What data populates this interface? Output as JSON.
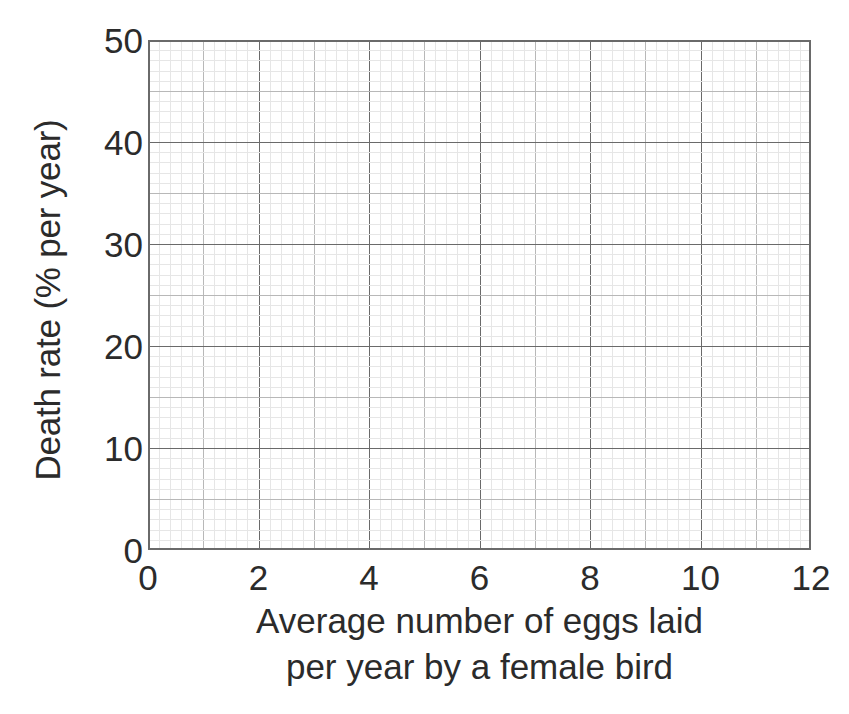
{
  "figure": {
    "background_color": "#ffffff",
    "text_color": "#2b2b2b"
  },
  "chart_data": {
    "type": "scatter",
    "title": "",
    "subtitle": "",
    "xlabel": "Average number of eggs laid per year by a female bird",
    "xlabel_line1": "Average number of eggs laid",
    "xlabel_line2": "per year by a female bird",
    "ylabel": "Death rate (% per year)",
    "xlim": [
      0,
      12
    ],
    "ylim": [
      0,
      50
    ],
    "xticks": [
      0,
      2,
      4,
      6,
      8,
      10,
      12
    ],
    "yticks": [
      0,
      10,
      20,
      30,
      40,
      50
    ],
    "xticklabels": [
      "0",
      "2",
      "4",
      "6",
      "8",
      "10",
      "12"
    ],
    "yticklabels": [
      "0",
      "10",
      "20",
      "30",
      "40",
      "50"
    ],
    "x_major_step": 2,
    "x_medium_step": 1,
    "x_minor_step": 0.2,
    "y_major_step": 10,
    "y_medium_step": 5,
    "y_minor_step": 1,
    "grid": "graph-paper",
    "grid_major_color": "#6a6a6a",
    "grid_medium_color": "#b8b8b8",
    "grid_minor_color": "#e6e6e6",
    "border_color": "#6a6a6a",
    "legend": null,
    "series": [],
    "x": [],
    "values": [],
    "annotations": [],
    "note": "Empty graph-paper axes supplied for the reader to plot data; no data points are drawn."
  }
}
